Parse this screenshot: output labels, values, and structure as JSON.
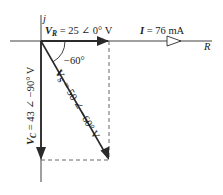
{
  "axes": {
    "real_label": "R",
    "imag_label": "j"
  },
  "phasors": {
    "vr": {
      "symbol": "V",
      "subscript": "R",
      "text": " = 25 ∠ 0° V",
      "magnitude": 25,
      "angle_deg": 0,
      "unit": "V"
    },
    "current": {
      "symbol": "I",
      "text": " = 76 mA",
      "magnitude": 76,
      "unit": "mA"
    },
    "vs": {
      "symbol": "V",
      "subscript": "S",
      "text": " = 50 ∠ −60° V",
      "magnitude": 50,
      "angle_deg": -60,
      "unit": "V"
    },
    "vc": {
      "symbol": "V",
      "subscript": "C",
      "text": " = 43 ∠ −90° V",
      "magnitude": 43,
      "angle_deg": -90,
      "unit": "V"
    }
  },
  "angle_marker": {
    "label": "−60°"
  },
  "colors": {
    "line": "#2a2a2a",
    "dashed": "#555555",
    "background": "#ffffff"
  }
}
